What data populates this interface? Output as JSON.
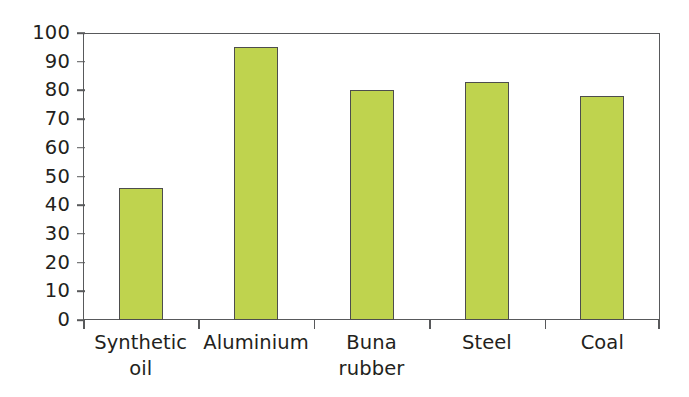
{
  "chart_data": {
    "type": "bar",
    "title": "",
    "subtitle": "",
    "xlabel": "",
    "ylabel": "",
    "categories": [
      "Synthetic oil",
      "Aluminium",
      "Buna rubber",
      "Steel",
      "Coal"
    ],
    "category_lines": [
      [
        "Synthetic",
        "oil"
      ],
      [
        "Aluminium",
        ""
      ],
      [
        "Buna",
        "rubber"
      ],
      [
        "Steel",
        ""
      ],
      [
        "Coal",
        ""
      ]
    ],
    "values": [
      46,
      95,
      80,
      83,
      78
    ],
    "ylim": [
      0,
      100
    ],
    "ytick_labels": [
      "0",
      "10",
      "20",
      "30",
      "40",
      "50",
      "60",
      "70",
      "80",
      "90",
      "100"
    ],
    "ytick_values": [
      0,
      10,
      20,
      30,
      40,
      50,
      60,
      70,
      80,
      90,
      100
    ],
    "grid": false,
    "legend": null,
    "legend_position": "none",
    "bar_fill_color": "#bfd34e",
    "bar_edge_color": "#4d4d4d",
    "axis_color": "#58595b",
    "text_color": "#231f20",
    "background_color": "#ffffff"
  }
}
